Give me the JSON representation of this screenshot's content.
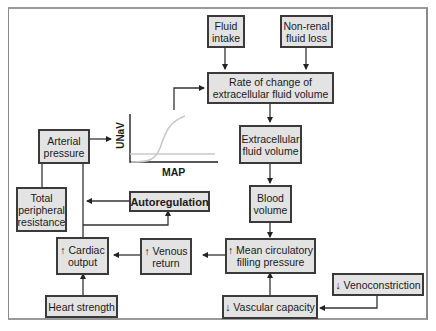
{
  "diagram": {
    "nodes": {
      "fluid_intake": "Fluid intake",
      "non_renal_loss": "Non-renal fluid loss",
      "rate_of_change": "Rate of change of extracellular fluid volume",
      "ecf_volume": "Extracellular fluid volume",
      "blood_volume": "Blood volume",
      "mean_circ_filling": "↑ Mean circulatory filling pressure",
      "vascular_capacity": "↓ Vascular capacity",
      "venoconstriction": "↓ Venoconstriction",
      "venous_return": "↑ Venous return",
      "cardiac_output": "↑ Cardiac output",
      "heart_strength": "Heart strength",
      "autoregulation": "Autoregulation",
      "tpr": "Total peripheral resistance",
      "arterial_pressure": "Arterial pressure"
    },
    "inset_chart": {
      "xlabel": "MAP",
      "ylabel": "UNaV",
      "curves": [
        "sigmoid output curve",
        "horizontal intake line"
      ]
    },
    "colors": {
      "box_fill": "#e3e3e3",
      "box_border": "#3a3a3a",
      "curve": "#c8c8c8"
    }
  }
}
